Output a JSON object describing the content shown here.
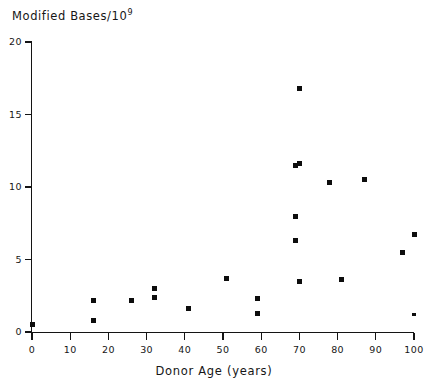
{
  "chart_data": {
    "type": "scatter",
    "title": "Modified Bases/10",
    "title_exponent": "9",
    "xlabel": "Donor Age (years)",
    "ylabel": "Modified Bases/10^9",
    "xlim": [
      0,
      100
    ],
    "ylim": [
      0,
      20
    ],
    "xticks": [
      0,
      10,
      20,
      30,
      40,
      50,
      60,
      70,
      80,
      90,
      100
    ],
    "yticks": [
      0,
      5,
      10,
      15,
      20
    ],
    "xtick_labels": [
      "0",
      "10",
      "20",
      "30",
      "40",
      "50",
      "60",
      "70",
      "80",
      "90",
      "100"
    ],
    "ytick_labels": [
      "0",
      "5",
      "10",
      "15",
      "20"
    ],
    "grid": false,
    "legend": false,
    "marker": "square",
    "marker_color": "#0d0d0d",
    "points": [
      {
        "x": 0,
        "y": 0.5,
        "size": "normal"
      },
      {
        "x": 16,
        "y": 2.2,
        "size": "normal"
      },
      {
        "x": 16,
        "y": 0.8,
        "size": "normal"
      },
      {
        "x": 26,
        "y": 2.2,
        "size": "normal"
      },
      {
        "x": 32,
        "y": 3.0,
        "size": "normal"
      },
      {
        "x": 32,
        "y": 2.4,
        "size": "normal"
      },
      {
        "x": 41,
        "y": 1.6,
        "size": "normal"
      },
      {
        "x": 51,
        "y": 3.7,
        "size": "normal"
      },
      {
        "x": 59,
        "y": 2.3,
        "size": "normal"
      },
      {
        "x": 59,
        "y": 1.3,
        "size": "normal"
      },
      {
        "x": 69,
        "y": 8.0,
        "size": "normal"
      },
      {
        "x": 69,
        "y": 6.3,
        "size": "normal"
      },
      {
        "x": 69,
        "y": 11.5,
        "size": "normal"
      },
      {
        "x": 70,
        "y": 16.8,
        "size": "normal"
      },
      {
        "x": 70,
        "y": 11.6,
        "size": "normal"
      },
      {
        "x": 70,
        "y": 3.5,
        "size": "normal"
      },
      {
        "x": 78,
        "y": 10.3,
        "size": "normal"
      },
      {
        "x": 81,
        "y": 3.6,
        "size": "normal"
      },
      {
        "x": 87,
        "y": 10.5,
        "size": "normal"
      },
      {
        "x": 97,
        "y": 5.5,
        "size": "normal"
      },
      {
        "x": 100,
        "y": 6.7,
        "size": "normal"
      },
      {
        "x": 100,
        "y": 1.2,
        "size": "small"
      }
    ]
  }
}
